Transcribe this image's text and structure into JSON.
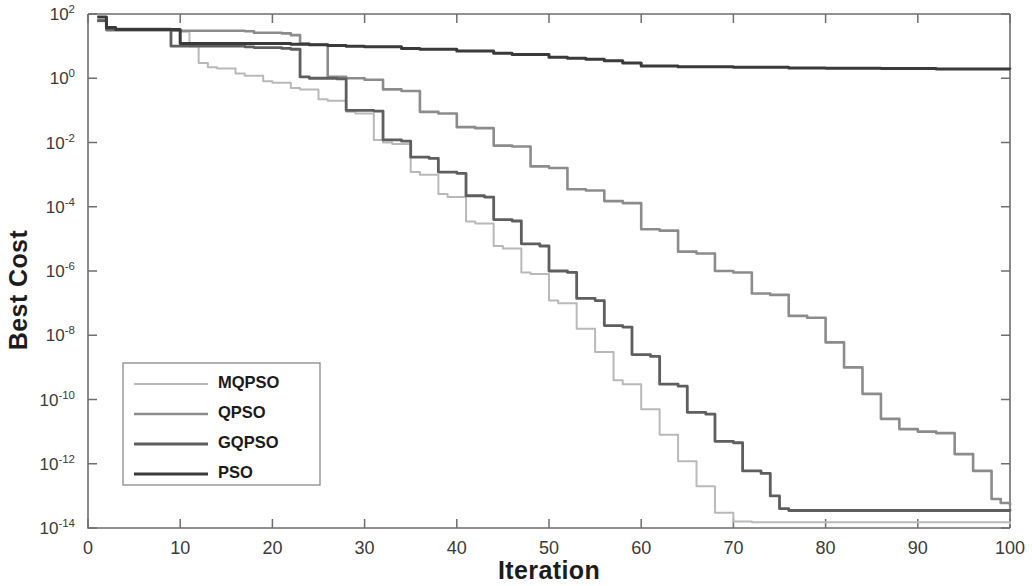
{
  "chart_data": {
    "type": "line",
    "title": "",
    "xlabel": "Iteration",
    "ylabel": "Best Cost",
    "xlim": [
      0,
      100
    ],
    "ylim": [
      1e-14,
      100
    ],
    "yscale": "log",
    "grid": false,
    "legend_position": "lower-left",
    "xticks": [
      0,
      10,
      20,
      30,
      40,
      50,
      60,
      70,
      80,
      90,
      100
    ],
    "xtick_labels": [
      "0",
      "10",
      "20",
      "30",
      "40",
      "50",
      "60",
      "70",
      "80",
      "90",
      "100"
    ],
    "yticks": [
      100,
      1,
      0.01,
      0.0001,
      1e-06,
      1e-08,
      1e-10,
      1e-12,
      1e-14
    ],
    "ytick_labels": [
      "10^2",
      "10^0",
      "10^-2",
      "10^-4",
      "10^-6",
      "10^-8",
      "10^-10",
      "10^-12",
      "10^-14"
    ],
    "ytick_mantissa": [
      "10",
      "10",
      "10",
      "10",
      "10",
      "10",
      "10",
      "10",
      "10"
    ],
    "ytick_exponents": [
      "2",
      "0",
      "-2",
      "-4",
      "-6",
      "-8",
      "-10",
      "-12",
      "-14"
    ],
    "series": [
      {
        "name": "MQPSO",
        "color": "#b9b9b9",
        "width": 2.0,
        "x": [
          1,
          2,
          8,
          10,
          11,
          12,
          13,
          14,
          16,
          17,
          19,
          20,
          22,
          23,
          25,
          26,
          28,
          29,
          31,
          32,
          33,
          35,
          36,
          38,
          39,
          41,
          42,
          44,
          45,
          47,
          48,
          50,
          51,
          53,
          55,
          57,
          58,
          60,
          62,
          64,
          66,
          68,
          70,
          72,
          100
        ],
        "y": [
          60.0,
          30.0,
          30.0,
          28.0,
          10.0,
          3.0,
          2.2,
          2.0,
          1.4,
          1.2,
          0.8,
          0.72,
          0.5,
          0.45,
          0.22,
          0.2,
          0.09,
          0.08,
          0.012,
          0.01,
          0.009,
          0.0012,
          0.001,
          0.00025,
          0.0002,
          3.5e-05,
          3e-05,
          6e-06,
          5e-06,
          9e-07,
          8e-07,
          1.2e-07,
          1e-07,
          1.6e-08,
          3e-09,
          4e-10,
          3e-10,
          5e-11,
          8e-12,
          1.2e-12,
          2e-13,
          3e-14,
          1.6e-14,
          1.5e-14,
          1.3e-14
        ]
      },
      {
        "name": "QPSO",
        "color": "#8c8c8c",
        "width": 2.6,
        "x": [
          1,
          2,
          8,
          9,
          17,
          18,
          21,
          22,
          23,
          24,
          26,
          28,
          30,
          32,
          34,
          36,
          38,
          40,
          42,
          44,
          46,
          48,
          50,
          52,
          54,
          56,
          58,
          60,
          62,
          64,
          66,
          68,
          70,
          72,
          74,
          76,
          78,
          80,
          82,
          84,
          86,
          88,
          90,
          92,
          94,
          96,
          98,
          99,
          100
        ],
        "y": [
          62.0,
          32.0,
          32.0,
          30.0,
          29.0,
          26.0,
          25.0,
          22.0,
          12.0,
          11.0,
          1.1,
          1.0,
          0.9,
          0.45,
          0.4,
          0.09,
          0.08,
          0.03,
          0.028,
          0.008,
          0.0075,
          0.0018,
          0.0016,
          0.00035,
          0.00032,
          0.00015,
          0.00013,
          2e-05,
          1.8e-05,
          4e-06,
          3.5e-06,
          1e-06,
          9e-07,
          2e-07,
          1.8e-07,
          4e-08,
          3.5e-08,
          6e-09,
          1e-09,
          1.5e-10,
          2.5e-11,
          1.2e-11,
          1e-11,
          9e-12,
          2e-12,
          6e-13,
          8e-14,
          6e-14,
          5e-14
        ]
      },
      {
        "name": "GQPSO",
        "color": "#5e5e5e",
        "width": 2.8,
        "x": [
          1,
          2,
          8,
          9,
          17,
          18,
          21,
          22,
          23,
          24,
          27,
          28,
          31,
          32,
          34,
          35,
          37,
          38,
          40,
          41,
          43,
          44,
          46,
          47,
          49,
          50,
          52,
          53,
          55,
          56,
          58,
          59,
          61,
          62,
          64,
          65,
          67,
          68,
          70,
          71,
          73,
          74,
          75,
          76,
          100
        ],
        "y": [
          62.0,
          34.0,
          34.0,
          10.0,
          9.5,
          9.0,
          8.5,
          8.0,
          1.1,
          1.0,
          0.95,
          0.1,
          0.095,
          0.012,
          0.011,
          0.0035,
          0.0032,
          0.0012,
          0.0011,
          0.00022,
          0.0002,
          4e-05,
          3.6e-05,
          7e-06,
          6e-06,
          1e-06,
          9e-07,
          1.4e-07,
          1.2e-07,
          2e-08,
          1.8e-08,
          2.5e-09,
          2.2e-09,
          3e-10,
          2.6e-10,
          4e-11,
          3.5e-11,
          5e-12,
          4.5e-12,
          6e-13,
          5e-13,
          1e-13,
          4e-14,
          3.5e-14,
          3.3e-14
        ]
      },
      {
        "name": "PSO",
        "color": "#3a3a3a",
        "width": 3.0,
        "x": [
          1,
          2,
          3,
          9,
          10,
          20,
          22,
          24,
          26,
          28,
          30,
          34,
          36,
          40,
          44,
          46,
          50,
          52,
          54,
          56,
          58,
          60,
          64,
          70,
          76,
          80,
          86,
          92,
          100
        ],
        "y": [
          80.0,
          38.0,
          33.0,
          33.0,
          12.0,
          12.0,
          11.5,
          11.0,
          10.5,
          10.0,
          9.5,
          8.5,
          8.0,
          7.0,
          6.0,
          5.5,
          4.5,
          4.2,
          3.9,
          3.5,
          3.0,
          2.4,
          2.3,
          2.2,
          2.1,
          2.05,
          2.0,
          1.95,
          1.9
        ]
      }
    ],
    "legend_entries": [
      {
        "label": "MQPSO",
        "color": "#b9b9b9",
        "width": 2.0
      },
      {
        "label": "QPSO",
        "color": "#8c8c8c",
        "width": 2.6
      },
      {
        "label": "GQPSO",
        "color": "#5e5e5e",
        "width": 2.8
      },
      {
        "label": "PSO",
        "color": "#3a3a3a",
        "width": 3.0
      }
    ]
  },
  "axes": {
    "ylabel": "Best Cost",
    "xlabel": "Iteration"
  }
}
